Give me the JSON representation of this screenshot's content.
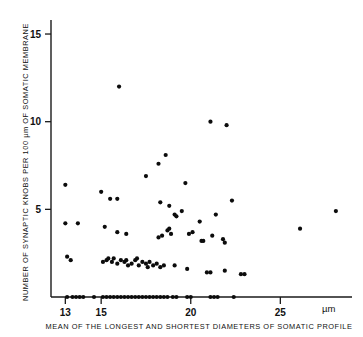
{
  "chart_data": {
    "type": "scatter",
    "title": "",
    "xlabel": "MEAN OF THE LONGEST AND SHORTEST DIAMETERS OF SOMATIC PROFILE",
    "ylabel": "NUMBER OF SYNAPTIC KNOBS PER 100 µm OF SOMATIC MEMBRANE",
    "x_unit": "µm",
    "xlim": [
      12.2,
      29.0
    ],
    "ylim": [
      0,
      15.8
    ],
    "xticks": [
      13,
      15,
      20,
      25
    ],
    "xtick_labels": [
      "13",
      "15",
      "20",
      "25"
    ],
    "yticks": [
      5,
      10,
      15
    ],
    "ytick_labels": [
      "5",
      "10",
      "15"
    ],
    "grid": false,
    "legend": false,
    "marker": "filled-circle",
    "marker_color": "#0c0c0c",
    "marker_size": 2.1,
    "points": [
      [
        13.1,
        0.0
      ],
      [
        13.4,
        0.0
      ],
      [
        13.6,
        0.0
      ],
      [
        13.8,
        0.0
      ],
      [
        14.0,
        0.0
      ],
      [
        14.6,
        0.0
      ],
      [
        15.1,
        0.0
      ],
      [
        15.3,
        0.0
      ],
      [
        15.5,
        0.0
      ],
      [
        15.7,
        0.0
      ],
      [
        15.9,
        0.0
      ],
      [
        16.1,
        0.0
      ],
      [
        16.3,
        0.0
      ],
      [
        16.5,
        0.0
      ],
      [
        16.7,
        0.0
      ],
      [
        16.9,
        0.0
      ],
      [
        17.1,
        0.0
      ],
      [
        17.3,
        0.0
      ],
      [
        17.5,
        0.0
      ],
      [
        17.7,
        0.0
      ],
      [
        17.9,
        0.0
      ],
      [
        18.1,
        0.0
      ],
      [
        18.3,
        0.0
      ],
      [
        18.5,
        0.0
      ],
      [
        18.7,
        0.0
      ],
      [
        19.0,
        0.0
      ],
      [
        19.2,
        0.0
      ],
      [
        19.8,
        0.0
      ],
      [
        20.0,
        0.0
      ],
      [
        21.1,
        0.0
      ],
      [
        21.3,
        0.0
      ],
      [
        21.5,
        0.0
      ],
      [
        22.4,
        0.0
      ],
      [
        13.1,
        2.3
      ],
      [
        13.3,
        2.1
      ],
      [
        15.1,
        2.0
      ],
      [
        15.3,
        2.1
      ],
      [
        15.4,
        2.2
      ],
      [
        15.6,
        2.0
      ],
      [
        15.7,
        2.2
      ],
      [
        15.9,
        1.9
      ],
      [
        16.1,
        2.1
      ],
      [
        16.3,
        2.0
      ],
      [
        16.5,
        1.8
      ],
      [
        16.7,
        1.9
      ],
      [
        16.9,
        2.1
      ],
      [
        17.1,
        1.8
      ],
      [
        17.3,
        2.0
      ],
      [
        17.5,
        1.9
      ],
      [
        17.7,
        2.0
      ],
      [
        17.9,
        1.8
      ],
      [
        18.1,
        1.9
      ],
      [
        18.3,
        1.7
      ],
      [
        18.5,
        1.8
      ],
      [
        16.4,
        2.1
      ],
      [
        17.0,
        2.2
      ],
      [
        17.6,
        1.7
      ],
      [
        19.1,
        1.8
      ],
      [
        19.8,
        1.6
      ],
      [
        20.9,
        1.4
      ],
      [
        21.1,
        1.4
      ],
      [
        21.9,
        1.5
      ],
      [
        22.8,
        1.3
      ],
      [
        23.0,
        1.3
      ],
      [
        13.0,
        4.2
      ],
      [
        13.7,
        4.2
      ],
      [
        15.2,
        4.0
      ],
      [
        15.9,
        3.7
      ],
      [
        16.4,
        3.6
      ],
      [
        18.2,
        3.4
      ],
      [
        18.4,
        3.5
      ],
      [
        18.7,
        3.8
      ],
      [
        18.8,
        3.9
      ],
      [
        18.9,
        3.6
      ],
      [
        19.9,
        3.6
      ],
      [
        20.5,
        4.3
      ],
      [
        20.6,
        3.2
      ],
      [
        20.7,
        3.2
      ],
      [
        21.2,
        3.5
      ],
      [
        21.8,
        3.3
      ],
      [
        21.9,
        3.1
      ],
      [
        13.0,
        6.4
      ],
      [
        15.0,
        6.0
      ],
      [
        15.5,
        5.6
      ],
      [
        15.9,
        5.6
      ],
      [
        18.3,
        5.4
      ],
      [
        18.8,
        5.2
      ],
      [
        19.5,
        4.9
      ],
      [
        19.1,
        4.7
      ],
      [
        19.2,
        4.6
      ],
      [
        19.7,
        6.5
      ],
      [
        21.4,
        4.7
      ],
      [
        22.3,
        5.5
      ],
      [
        20.1,
        3.7
      ],
      [
        17.5,
        6.9
      ],
      [
        18.2,
        7.6
      ],
      [
        18.6,
        8.1
      ],
      [
        16.0,
        12.0
      ],
      [
        21.1,
        10.0
      ],
      [
        22.0,
        9.8
      ],
      [
        26.1,
        3.9
      ],
      [
        28.1,
        4.9
      ]
    ]
  }
}
